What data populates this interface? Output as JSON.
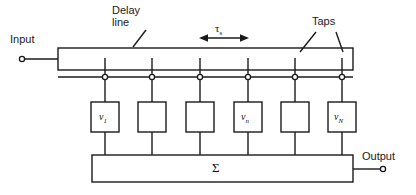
{
  "figure": {
    "type": "block-diagram",
    "colors": {
      "line": "#1a1a1a",
      "background": "#ffffff",
      "text": "#1a1a1a"
    }
  },
  "labels": {
    "input": "Input",
    "output": "Output",
    "delay_line": "Delay\nline",
    "taps": "Taps",
    "tau": "τ",
    "tau_sub": "s",
    "summation": "Σ"
  },
  "weights": [
    {
      "index": 1,
      "label": "v",
      "sub": "1",
      "has_label": true
    },
    {
      "index": 2,
      "label": "",
      "sub": "",
      "has_label": false
    },
    {
      "index": 3,
      "label": "",
      "sub": "",
      "has_label": false
    },
    {
      "index": 4,
      "label": "v",
      "sub": "n",
      "has_label": true
    },
    {
      "index": 5,
      "label": "",
      "sub": "",
      "has_label": false
    },
    {
      "index": 6,
      "label": "v",
      "sub": "N",
      "has_label": true
    }
  ],
  "geometry": {
    "tap_count": 6,
    "tap_x": [
      105,
      152,
      200,
      248,
      295,
      342
    ],
    "delay_line": {
      "x": 58,
      "y": 48,
      "w": 295,
      "h": 22
    },
    "bus_y": 77,
    "box": {
      "w": 28,
      "h": 30,
      "top": 102
    },
    "sum_bar": {
      "x": 92,
      "y": 155,
      "w": 261,
      "h": 27
    },
    "input_terminal": {
      "x": 22,
      "y": 59
    },
    "output_terminal": {
      "x": 383,
      "y": 169
    },
    "tau_span": {
      "x1": 200,
      "x2": 248,
      "y": 38
    }
  }
}
